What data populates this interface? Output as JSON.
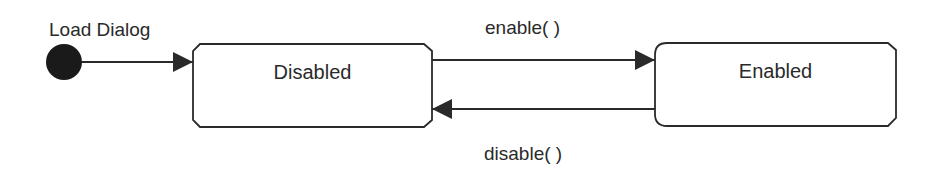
{
  "diagram": {
    "type": "state-machine",
    "initial": {
      "label": "Load Dialog"
    },
    "states": [
      {
        "id": "disabled",
        "label": "Disabled"
      },
      {
        "id": "enabled",
        "label": "Enabled"
      }
    ],
    "transitions": [
      {
        "from": "initial",
        "to": "disabled",
        "label": ""
      },
      {
        "from": "disabled",
        "to": "enabled",
        "label": "enable( )"
      },
      {
        "from": "enabled",
        "to": "disabled",
        "label": "disable( )"
      }
    ],
    "colors": {
      "stroke": "#2a2a2a",
      "fill": "#ffffff",
      "initial_dot": "#1a1a1a"
    }
  }
}
